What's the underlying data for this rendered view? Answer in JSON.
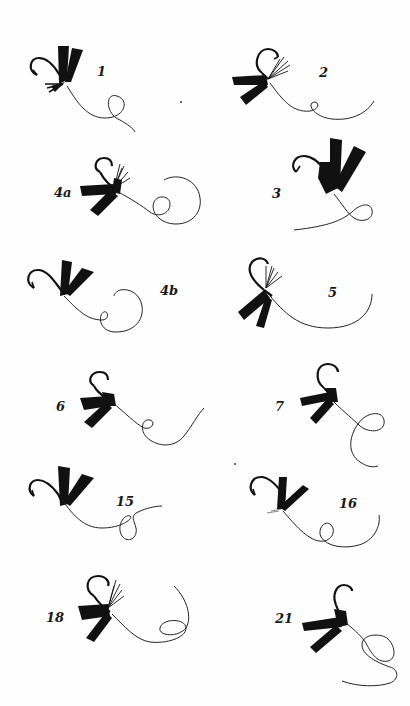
{
  "plate": {
    "background": "#fefefe",
    "ink": "#111111",
    "figures": [
      {
        "id": "1",
        "label": "1"
      },
      {
        "id": "2",
        "label": "2"
      },
      {
        "id": "4a",
        "label": "4a"
      },
      {
        "id": "3",
        "label": "3"
      },
      {
        "id": "4b",
        "label": "4b"
      },
      {
        "id": "5",
        "label": "5"
      },
      {
        "id": "6",
        "label": "6"
      },
      {
        "id": "7",
        "label": "7"
      },
      {
        "id": "15",
        "label": "15"
      },
      {
        "id": "16",
        "label": "16"
      },
      {
        "id": "18",
        "label": "18"
      },
      {
        "id": "21",
        "label": "21"
      }
    ]
  }
}
